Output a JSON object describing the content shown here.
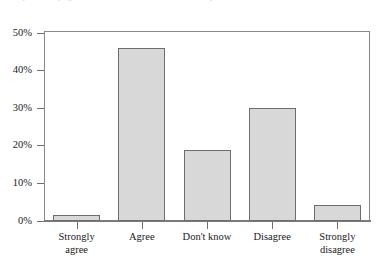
{
  "figure": {
    "caption_remnant": "the top of this page is the cut-off tail of a line of body text",
    "background_color": "#ffffff"
  },
  "chart_data": {
    "type": "bar",
    "title": "",
    "subtitle": "",
    "xlabel": "",
    "ylabel": "",
    "categories": [
      "Strongly agree",
      "Agree",
      "Don't know",
      "Disagree",
      "Strongly disagree"
    ],
    "category_lines": [
      [
        "Strongly",
        "agree"
      ],
      [
        "Agree"
      ],
      [
        "Don't know"
      ],
      [
        "Disagree"
      ],
      [
        "Strongly",
        "disagree"
      ]
    ],
    "values": [
      1.7,
      46,
      19,
      30,
      4.3
    ],
    "ylim": [
      0,
      52
    ],
    "ytick_values": [
      0,
      10,
      20,
      30,
      40,
      50
    ],
    "ytick_labels": [
      "0%",
      "10%",
      "20%",
      "30%",
      "40%",
      "50%"
    ],
    "grid": false,
    "legend": null,
    "bar_fill_color": "#d8d8d8",
    "bar_edge_color": "#6d6d6d",
    "axis_color": "#7a7a7a"
  }
}
